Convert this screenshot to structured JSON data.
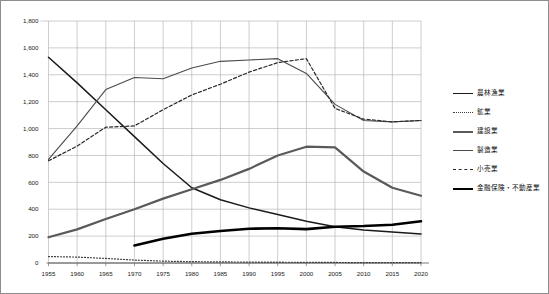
{
  "chart_data": {
    "type": "line",
    "title": "",
    "subtitle": "",
    "xlabel": "",
    "ylabel": "",
    "xlim": [
      1955,
      2020
    ],
    "ylim": [
      0,
      1800
    ],
    "ytick_step": 200,
    "xtick_step": 5,
    "grid": true,
    "legend_position": "right",
    "x": [
      1955,
      1960,
      1965,
      1970,
      1975,
      1980,
      1985,
      1990,
      1995,
      2000,
      2005,
      2010,
      2015,
      2020
    ],
    "xtick_labels": [
      "1955",
      "1960",
      "1965",
      "1970",
      "1975",
      "1980",
      "1985",
      "1990",
      "1995",
      "2000",
      "2005",
      "2010",
      "2015",
      "2020"
    ],
    "ytick_labels": [
      "0",
      "200",
      "400",
      "600",
      "800",
      "1,000",
      "1,200",
      "1,400",
      "1,600",
      "1,800"
    ],
    "ytick_values": [
      0,
      200,
      400,
      600,
      800,
      1000,
      1200,
      1400,
      1600,
      1800
    ],
    "series": [
      {
        "name": "農林漁業",
        "style": "solid-thick",
        "color": "#1a1a1a",
        "width": 1.5,
        "dash": "",
        "values": [
          1530,
          1340,
          1140,
          940,
          740,
          560,
          470,
          410,
          360,
          310,
          270,
          245,
          230,
          215
        ]
      },
      {
        "name": "鉱業",
        "style": "dotted",
        "color": "#3a3a3a",
        "width": 1.2,
        "dash": "1,2",
        "values": [
          48,
          44,
          34,
          22,
          14,
          10,
          8,
          7,
          6,
          5,
          4,
          3,
          3,
          3
        ]
      },
      {
        "name": "建設業",
        "style": "solid-med",
        "color": "#5a5a5a",
        "width": 2.2,
        "dash": "",
        "values": [
          192,
          250,
          327,
          400,
          479,
          548,
          618,
          700,
          800,
          865,
          860,
          680,
          560,
          500
        ]
      },
      {
        "name": "製造業",
        "style": "solid-thin",
        "color": "#4a4a4a",
        "width": 1.1,
        "dash": "",
        "values": [
          770,
          1020,
          1290,
          1380,
          1370,
          1450,
          1500,
          1510,
          1520,
          1410,
          1180,
          1060,
          1050,
          1060
        ]
      },
      {
        "name": "小売業",
        "style": "dashed",
        "color": "#2a2a2a",
        "width": 1.2,
        "dash": "3.2,2.2",
        "values": [
          760,
          870,
          1010,
          1020,
          1140,
          1250,
          1330,
          1420,
          1490,
          1520,
          1150,
          1070,
          1050,
          1060
        ]
      },
      {
        "name": "金融保険・不動産業",
        "style": "bold",
        "color": "#000000",
        "width": 2.6,
        "dash": "",
        "values": [
          null,
          null,
          null,
          130,
          180,
          218,
          238,
          255,
          258,
          252,
          270,
          275,
          285,
          310
        ]
      }
    ]
  },
  "legend": {
    "items": [
      {
        "label": "農林漁業",
        "style": "sw-solid-thick"
      },
      {
        "label": "鉱業",
        "style": "sw-dotted"
      },
      {
        "label": "建設業",
        "style": "sw-solid-med"
      },
      {
        "label": "製造業",
        "style": "sw-solid-thin"
      },
      {
        "label": "小売業",
        "style": "sw-dashed"
      },
      {
        "label": "金融保険・不動産業",
        "style": "sw-bold"
      }
    ]
  },
  "colors": {
    "background": "#ffffff",
    "grid": "#b4b4b4",
    "axis": "#6e6e6e",
    "frame": "#8d8d8d",
    "text": "#1a1a1a"
  }
}
